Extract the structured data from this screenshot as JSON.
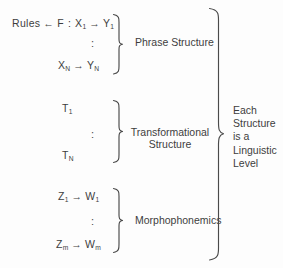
{
  "figure": {
    "background_color": "#fdfdfd",
    "ink_color": "#3d3d3d",
    "groups": [
      {
        "id": "phrase-structure",
        "label": "Phrase Structure",
        "first_line": "Rules ← F : X₁ → Y₁",
        "first_line_parts": {
          "lhs": "Rules",
          "assign_arrow": "←",
          "function": "F",
          "colon": ":",
          "from": "X",
          "from_sub": "1",
          "rule_arrow": "→",
          "to": "Y",
          "to_sub": "1"
        },
        "ellipsis": ":",
        "last_line_parts": {
          "from": "X",
          "from_sub": "N",
          "rule_arrow": "→",
          "to": "Y",
          "to_sub": "N"
        },
        "last_line": "Xₙ → Yₙ"
      },
      {
        "id": "transformational-structure",
        "label_line1": "Transformational",
        "label_line2": "Structure",
        "first_line_parts": {
          "symbol": "T",
          "symbol_sub": "1"
        },
        "ellipsis": ":",
        "last_line_parts": {
          "symbol": "T",
          "symbol_sub": "N"
        }
      },
      {
        "id": "morphophonemics",
        "label": "Morphophonemics",
        "first_line_parts": {
          "from": "Z",
          "from_sub": "1",
          "rule_arrow": "→",
          "to": "W",
          "to_sub": "1"
        },
        "ellipsis": ":",
        "last_line_parts": {
          "from": "Z",
          "from_sub": "m",
          "rule_arrow": "→",
          "to": "W",
          "to_sub": "m"
        }
      }
    ],
    "outer_label": {
      "lines": [
        "Each",
        "Structure",
        "is a",
        "Linguistic",
        "Level"
      ],
      "line1": "Each",
      "line2": "Structure",
      "line3": "is a",
      "line4": "Linguistic",
      "line5": "Level"
    }
  }
}
